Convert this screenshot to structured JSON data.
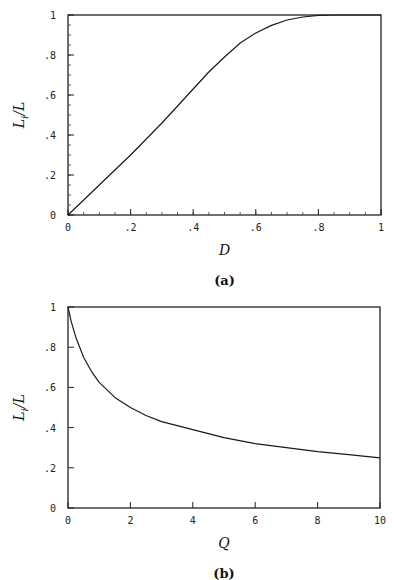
{
  "chart_data": [
    {
      "type": "line",
      "panel": "a",
      "caption": "(a)",
      "xlabel": "D",
      "ylabel": "L_i/L",
      "ylabel_main": "L",
      "ylabel_sub": "i",
      "ylabel_tail": "/L",
      "xlim": [
        0,
        1
      ],
      "ylim": [
        0,
        1
      ],
      "grid": false,
      "legend": null,
      "x_ticks": [
        0,
        0.2,
        0.4,
        0.6,
        0.8,
        1
      ],
      "x_tick_labels": [
        "0",
        ".2",
        ".4",
        ".6",
        ".8",
        "1"
      ],
      "y_ticks": [
        0,
        0.2,
        0.4,
        0.6,
        0.8,
        1
      ],
      "y_tick_labels": [
        "0",
        ".2",
        ".4",
        ".6",
        ".8",
        "1"
      ],
      "minor_ticks": true,
      "minor_step": 0.05,
      "series": [
        {
          "name": "L_i/L vs D",
          "x": [
            0,
            0.05,
            0.1,
            0.15,
            0.2,
            0.25,
            0.3,
            0.35,
            0.4,
            0.45,
            0.5,
            0.55,
            0.6,
            0.65,
            0.7,
            0.75,
            0.8,
            0.85,
            0.9,
            0.95,
            1.0
          ],
          "y": [
            0,
            0.075,
            0.15,
            0.225,
            0.3,
            0.38,
            0.46,
            0.545,
            0.63,
            0.715,
            0.79,
            0.86,
            0.91,
            0.948,
            0.975,
            0.99,
            0.998,
            1.0,
            1.0,
            1.0,
            1.0
          ]
        }
      ],
      "frame_px": {
        "left": 68,
        "top": 15,
        "right": 381,
        "bottom": 215
      }
    },
    {
      "type": "line",
      "panel": "b",
      "caption": "(b)",
      "xlabel": "Q",
      "ylabel": "L_i/L",
      "ylabel_main": "L",
      "ylabel_sub": "i",
      "ylabel_tail": "/L",
      "xlim": [
        0,
        10
      ],
      "ylim": [
        0,
        1
      ],
      "grid": false,
      "legend": null,
      "x_ticks": [
        0,
        2,
        4,
        6,
        8,
        10
      ],
      "x_tick_labels": [
        "0",
        "2",
        "4",
        "6",
        "8",
        "10"
      ],
      "y_ticks": [
        0,
        0.2,
        0.4,
        0.6,
        0.8,
        1
      ],
      "y_tick_labels": [
        "0",
        ".2",
        ".4",
        ".6",
        ".8",
        "1"
      ],
      "minor_ticks": false,
      "series": [
        {
          "name": "L_i/L vs Q",
          "x": [
            0,
            0.1,
            0.25,
            0.5,
            0.75,
            1,
            1.5,
            2,
            2.5,
            3,
            4,
            5,
            6,
            7,
            8,
            9,
            10
          ],
          "y": [
            1.0,
            0.93,
            0.85,
            0.75,
            0.68,
            0.625,
            0.55,
            0.5,
            0.46,
            0.43,
            0.39,
            0.35,
            0.32,
            0.3,
            0.28,
            0.265,
            0.25
          ]
        }
      ],
      "frame_px": {
        "left": 68,
        "top": 307,
        "right": 380,
        "bottom": 508
      }
    }
  ]
}
